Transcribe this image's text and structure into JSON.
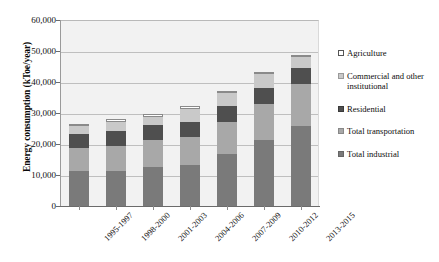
{
  "chart_data": {
    "type": "bar",
    "stacked": true,
    "title": "",
    "xlabel": "",
    "ylabel": "Energy consumption (kToe/year)",
    "ylim": [
      0,
      60000
    ],
    "ytick_labels": [
      "60,000",
      "50,000",
      "40,000",
      "30,000",
      "20,000",
      "10,000",
      "0"
    ],
    "ytick_values": [
      60000,
      50000,
      40000,
      30000,
      20000,
      10000,
      0
    ],
    "grid": true,
    "legend_position": "right",
    "categories": [
      "1995-1997",
      "1998-2000",
      "2001-2003",
      "2004-2006",
      "2007-2009",
      "2010-2012",
      "2013-2015"
    ],
    "series": [
      {
        "name": "Total industrial",
        "color": "#7a7a7a",
        "values": [
          11200,
          11300,
          12600,
          13300,
          16800,
          21400,
          25700
        ]
      },
      {
        "name": "Total transportation",
        "color": "#a8a8a8",
        "values": [
          7400,
          8200,
          8700,
          9000,
          10200,
          11400,
          13600
        ]
      },
      {
        "name": "Residential",
        "color": "#4f4f4f",
        "values": [
          4600,
          4600,
          4700,
          4900,
          5300,
          5400,
          5300
        ]
      },
      {
        "name": "Commercial and other institutional",
        "color": "#c9c9c9",
        "values": [
          2500,
          3000,
          2800,
          4200,
          4200,
          4300,
          3500
        ]
      },
      {
        "name": "Agriculture",
        "color": "#ffffff",
        "values": [
          800,
          1100,
          800,
          800,
          700,
          700,
          600
        ]
      }
    ],
    "totals": [
      26500,
      28200,
      29600,
      32200,
      37200,
      43200,
      48700
    ]
  },
  "legend": {
    "items": [
      {
        "label": "Agriculture",
        "swatch": "sw-agriculture"
      },
      {
        "label": "Commercial and other institutional",
        "swatch": "sw-commercial"
      },
      {
        "label": "Residential",
        "swatch": "sw-residential"
      },
      {
        "label": "Total transportation",
        "swatch": "sw-transportation"
      },
      {
        "label": "Total industrial",
        "swatch": "sw-industrial"
      }
    ]
  }
}
